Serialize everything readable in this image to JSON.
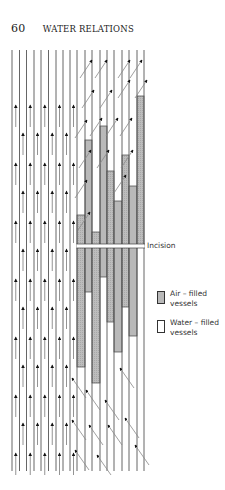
{
  "header": {
    "page_number": "60",
    "running_title": "WATER RELATIONS"
  },
  "diagram": {
    "incision_label": "Incision",
    "colors": {
      "line": "#555555",
      "air_fill": "#b9b9b9",
      "water_fill": "#ffffff",
      "arrow": "#111111"
    },
    "vessel_lines_x": [
      12,
      19.5,
      26.5,
      34,
      41,
      48.5,
      56,
      63,
      70,
      77,
      85,
      92,
      100,
      107,
      114,
      122,
      129,
      137,
      144
    ],
    "vessel_top_y": 50,
    "vessel_bottom_y": 471,
    "incision_y": 246,
    "affected_columns": [
      {
        "x0": 77,
        "x1": 85,
        "air_top": 215,
        "air_bottom": 367
      },
      {
        "x0": 85,
        "x1": 92,
        "air_top": 140,
        "air_bottom": 292
      },
      {
        "x0": 92,
        "x1": 100,
        "air_top": 232,
        "air_bottom": 383
      },
      {
        "x0": 100,
        "x1": 107,
        "air_top": 126,
        "air_bottom": 277
      },
      {
        "x0": 107,
        "x1": 114,
        "air_top": 171,
        "air_bottom": 322
      },
      {
        "x0": 114,
        "x1": 122,
        "air_top": 201,
        "air_bottom": 352
      },
      {
        "x0": 122,
        "x1": 129,
        "air_top": 155,
        "air_bottom": 307
      },
      {
        "x0": 129,
        "x1": 137,
        "air_top": 186,
        "air_bottom": 336
      },
      {
        "x0": 137,
        "x1": 144,
        "air_top": 96,
        "air_bottom": 246
      }
    ]
  },
  "legend": {
    "items": [
      {
        "label_line1": "Air – filled",
        "label_line2": "vessels",
        "type": "air"
      },
      {
        "label_line1": "Water – filled",
        "label_line2": "vessels",
        "type": "water"
      }
    ]
  }
}
